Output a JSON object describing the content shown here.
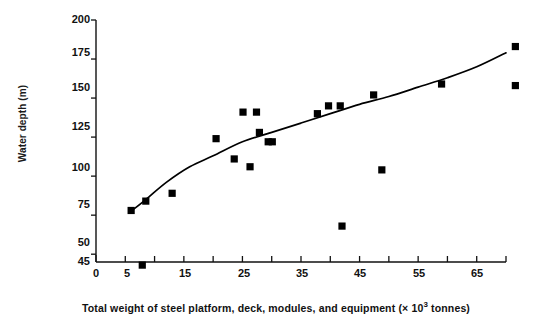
{
  "chart_data": {
    "type": "scatter",
    "title": "",
    "xlabel": "Total weight of steel platform, deck, modules, and equipment (× 10³ tonnes)",
    "ylabel": "Water depth (m)",
    "xlim": [
      0,
      70
    ],
    "ylim": [
      45,
      200
    ],
    "grid": false,
    "legend": "none",
    "xticks": [
      0,
      5,
      15,
      25,
      35,
      45,
      55,
      65
    ],
    "xticks_minor": [
      10,
      20,
      30,
      40,
      50,
      60,
      70
    ],
    "yticks": [
      45,
      50,
      75,
      100,
      125,
      150,
      175,
      200
    ],
    "marker": "filled-square",
    "marker_color": "#000000",
    "line_color": "#000000",
    "points": [
      {
        "x": 6.0,
        "y": 78
      },
      {
        "x": 7.9,
        "y": 43
      },
      {
        "x": 8.5,
        "y": 84
      },
      {
        "x": 13.0,
        "y": 89
      },
      {
        "x": 20.5,
        "y": 124
      },
      {
        "x": 23.6,
        "y": 111
      },
      {
        "x": 25.1,
        "y": 141
      },
      {
        "x": 27.4,
        "y": 141
      },
      {
        "x": 26.3,
        "y": 106
      },
      {
        "x": 27.9,
        "y": 128
      },
      {
        "x": 29.4,
        "y": 122
      },
      {
        "x": 30.1,
        "y": 122
      },
      {
        "x": 37.8,
        "y": 140
      },
      {
        "x": 39.7,
        "y": 145
      },
      {
        "x": 41.7,
        "y": 145
      },
      {
        "x": 42.0,
        "y": 68
      },
      {
        "x": 47.4,
        "y": 152
      },
      {
        "x": 48.8,
        "y": 104
      },
      {
        "x": 59.0,
        "y": 159
      },
      {
        "x": 71.6,
        "y": 183
      },
      {
        "x": 71.6,
        "y": 158
      }
    ],
    "trend_line": {
      "name": "fitted curve",
      "points": [
        {
          "x": 5.8,
          "y": 77
        },
        {
          "x": 8.5,
          "y": 85
        },
        {
          "x": 12.0,
          "y": 96
        },
        {
          "x": 16.0,
          "y": 106
        },
        {
          "x": 20.0,
          "y": 113
        },
        {
          "x": 25.0,
          "y": 122
        },
        {
          "x": 30.0,
          "y": 128
        },
        {
          "x": 35.0,
          "y": 134
        },
        {
          "x": 40.0,
          "y": 140
        },
        {
          "x": 45.0,
          "y": 146
        },
        {
          "x": 50.0,
          "y": 151
        },
        {
          "x": 55.0,
          "y": 157
        },
        {
          "x": 60.0,
          "y": 163
        },
        {
          "x": 65.0,
          "y": 170
        },
        {
          "x": 70.0,
          "y": 179
        }
      ]
    }
  },
  "axis": {
    "ylabel": "Water depth (m)",
    "xlabel_prefix": "Total weight of steel platform, deck, modules, and equipment (× 10",
    "xlabel_sup": "3",
    "xlabel_suffix": " tonnes)",
    "ytick_labels": [
      "200",
      "175",
      "150",
      "125",
      "100",
      "75",
      "50",
      "45"
    ],
    "xtick_labels": [
      "0",
      "5",
      "15",
      "25",
      "35",
      "45",
      "55",
      "65"
    ]
  }
}
